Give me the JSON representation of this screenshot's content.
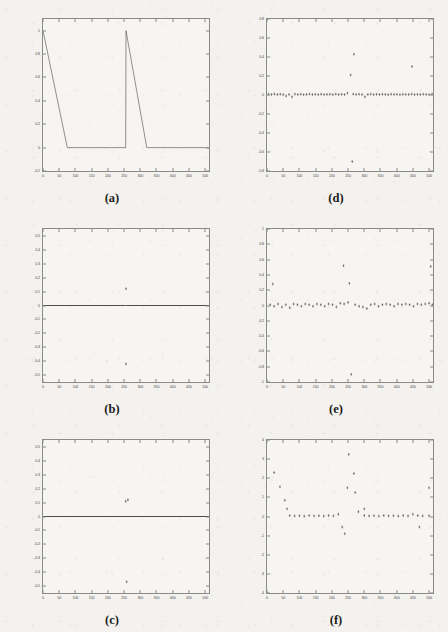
{
  "figure": {
    "background_color": "#f3f2ee",
    "axis_color": "#8a8a86",
    "data_color": "#3a3a38",
    "panel_count": 6
  },
  "chart_data": [
    {
      "type": "line",
      "panel": "a",
      "caption": "(a)",
      "title": "",
      "xlabel": "",
      "ylabel": "",
      "xlim": [
        0,
        512
      ],
      "ylim": [
        -0.2,
        1.1
      ],
      "grid": false,
      "legend": null,
      "xticks": [
        0,
        50,
        100,
        150,
        200,
        250,
        300,
        350,
        400,
        450,
        500
      ],
      "yticks": [
        -0.2,
        0,
        0.2,
        0.4,
        0.6,
        0.8,
        1
      ],
      "ytick_labels": [
        "-0.2",
        "0",
        "0.2",
        "0.4",
        "0.6",
        "0.8",
        "1"
      ],
      "series": [
        {
          "name": "autocorrelation",
          "x": [
            0,
            75,
            255,
            256,
            320,
            512
          ],
          "values": [
            1,
            0,
            0,
            1,
            0,
            0
          ]
        }
      ]
    },
    {
      "type": "scatter",
      "panel": "d",
      "caption": "(d)",
      "title": "",
      "xlabel": "",
      "ylabel": "",
      "xlim": [
        0,
        512
      ],
      "ylim": [
        -0.8,
        0.8
      ],
      "grid": false,
      "legend": null,
      "xticks": [
        0,
        50,
        100,
        150,
        200,
        250,
        300,
        350,
        400,
        450,
        500
      ],
      "yticks": [
        -0.8,
        -0.6,
        -0.4,
        -0.2,
        0,
        0.2,
        0.4,
        0.6,
        0.8
      ],
      "ytick_labels": [
        "-0.8",
        "-0.6",
        "-0.4",
        "-0.2",
        "0",
        "0.2",
        "0.4",
        "0.6",
        "0.8"
      ],
      "series": [
        {
          "name": "residual",
          "x": [
            5,
            14,
            23,
            32,
            41,
            50,
            59,
            68,
            77,
            86,
            95,
            104,
            113,
            122,
            131,
            140,
            149,
            158,
            167,
            176,
            185,
            194,
            203,
            212,
            221,
            230,
            239,
            248,
            266,
            275,
            284,
            293,
            302,
            311,
            320,
            329,
            338,
            347,
            356,
            365,
            374,
            383,
            392,
            401,
            410,
            419,
            428,
            437,
            446,
            455,
            464,
            473,
            482,
            491,
            500,
            509
          ],
          "values": [
            0.01,
            0.005,
            0.01,
            0.005,
            0.008,
            0.004,
            -0.01,
            0.006,
            -0.02,
            0.01,
            0.005,
            0.008,
            0.004,
            0.006,
            0.01,
            0.005,
            0.007,
            0.004,
            0.009,
            0.005,
            0.006,
            0.008,
            0.004,
            0.01,
            0.005,
            0.007,
            0.004,
            0.02,
            0.01,
            0.006,
            0.008,
            0.005,
            -0.02,
            0.006,
            0.009,
            0.004,
            0.007,
            0.005,
            0.008,
            0.006,
            0.004,
            0.009,
            0.005,
            0.007,
            0.004,
            0.008,
            0.006,
            0.005,
            0.009,
            0.004,
            0.007,
            0.005,
            0.008,
            0.006,
            0.004,
            0.01
          ]
        },
        {
          "name": "outliers",
          "x": [
            258,
            268,
            263,
            447
          ],
          "values": [
            0.21,
            0.43,
            -0.7,
            0.3
          ]
        }
      ]
    },
    {
      "type": "line",
      "panel": "b",
      "caption": "(b)",
      "title": "",
      "xlabel": "",
      "ylabel": "",
      "xlim": [
        0,
        512
      ],
      "ylim": [
        -0.55,
        0.55
      ],
      "grid": false,
      "legend": null,
      "xticks": [
        0,
        50,
        100,
        150,
        200,
        250,
        300,
        350,
        400,
        450,
        500
      ],
      "yticks": [
        -0.5,
        -0.4,
        -0.3,
        -0.2,
        -0.1,
        0,
        0.1,
        0.2,
        0.3,
        0.4,
        0.5
      ],
      "ytick_labels": [
        "-0.5",
        "-0.4",
        "-0.3",
        "-0.2",
        "-0.1",
        "0",
        "0.1",
        "0.2",
        "0.3",
        "0.4",
        "0.5"
      ],
      "series": [
        {
          "name": "flat-signal",
          "x": [
            0,
            255,
            258,
            512
          ],
          "values": [
            0,
            0,
            0,
            0
          ]
        },
        {
          "name": "outliers",
          "x": [
            256,
            256
          ],
          "values": [
            0.12,
            -0.42
          ]
        }
      ]
    },
    {
      "type": "scatter",
      "panel": "e",
      "caption": "(e)",
      "title": "",
      "xlabel": "",
      "ylabel": "",
      "xlim": [
        0,
        512
      ],
      "ylim": [
        -1,
        1
      ],
      "grid": false,
      "legend": null,
      "xticks": [
        0,
        50,
        100,
        150,
        200,
        250,
        300,
        350,
        400,
        450,
        500
      ],
      "yticks": [
        -1,
        -0.8,
        -0.6,
        -0.4,
        -0.2,
        0,
        0.2,
        0.4,
        0.6,
        0.8,
        1
      ],
      "ytick_labels": [
        "-1",
        "-0.8",
        "-0.6",
        "-0.4",
        "-0.2",
        "0",
        "0.2",
        "0.4",
        "0.6",
        "0.8",
        "1"
      ],
      "series": [
        {
          "name": "residual",
          "x": [
            10,
            22,
            34,
            46,
            58,
            70,
            82,
            94,
            106,
            118,
            130,
            142,
            154,
            166,
            178,
            190,
            202,
            214,
            226,
            238,
            250,
            272,
            284,
            296,
            308,
            320,
            332,
            344,
            356,
            368,
            380,
            392,
            404,
            416,
            428,
            440,
            452,
            464,
            476,
            488,
            500,
            510
          ],
          "values": [
            0.01,
            -0.01,
            0.02,
            -0.02,
            0.01,
            -0.03,
            0.02,
            0.01,
            -0.01,
            0.02,
            0.01,
            -0.01,
            0.02,
            0.01,
            -0.01,
            0.02,
            0.01,
            -0.02,
            0.03,
            0.02,
            0.04,
            0.01,
            -0.01,
            -0.02,
            -0.04,
            0.01,
            0.02,
            -0.01,
            0.01,
            0.02,
            0.01,
            -0.01,
            0.02,
            0.01,
            0.02,
            0.01,
            -0.01,
            0.02,
            0.01,
            0.02,
            0.03,
            0.01
          ]
        },
        {
          "name": "outliers",
          "x": [
            18,
            236,
            254,
            260,
            505
          ],
          "values": [
            0.28,
            0.52,
            0.29,
            -0.9,
            0.51
          ]
        }
      ]
    },
    {
      "type": "line",
      "panel": "c",
      "caption": "(c)",
      "title": "",
      "xlabel": "",
      "ylabel": "",
      "xlim": [
        0,
        512
      ],
      "ylim": [
        -0.55,
        0.55
      ],
      "grid": false,
      "legend": null,
      "xticks": [
        0,
        50,
        100,
        150,
        200,
        250,
        300,
        350,
        400,
        450,
        500
      ],
      "yticks": [
        -0.5,
        -0.4,
        -0.3,
        -0.2,
        -0.1,
        0,
        0.1,
        0.2,
        0.3,
        0.4,
        0.5
      ],
      "ytick_labels": [
        "-0.5",
        "-0.4",
        "-0.3",
        "-0.2",
        "-0.1",
        "0",
        "0.1",
        "0.2",
        "0.3",
        "0.4",
        "0.5"
      ],
      "series": [
        {
          "name": "flat-signal",
          "x": [
            0,
            253,
            262,
            512
          ],
          "values": [
            0,
            0,
            0,
            0
          ]
        },
        {
          "name": "outliers",
          "x": [
            255,
            262,
            258
          ],
          "values": [
            0.11,
            0.12,
            -0.47
          ]
        }
      ]
    },
    {
      "type": "scatter",
      "panel": "f",
      "caption": "(f)",
      "title": "",
      "xlabel": "",
      "ylabel": "",
      "xlim": [
        0,
        512
      ],
      "ylim": [
        -4,
        4
      ],
      "grid": false,
      "legend": null,
      "xticks": [
        0,
        50,
        100,
        150,
        200,
        250,
        300,
        350,
        400,
        450,
        500
      ],
      "yticks": [
        -4,
        -3,
        -2,
        -1,
        0,
        1,
        2,
        3,
        4
      ],
      "ytick_labels": [
        "-4",
        "-3",
        "-2",
        "-1",
        "0",
        "1",
        "2",
        "3",
        "4"
      ],
      "series": [
        {
          "name": "residual",
          "x": [
            70,
            85,
            100,
            115,
            130,
            145,
            160,
            175,
            190,
            205,
            220,
            300,
            315,
            330,
            345,
            360,
            375,
            390,
            405,
            420,
            435,
            450,
            465,
            480,
            500
          ],
          "values": [
            0.05,
            0.03,
            0.04,
            0.02,
            0.05,
            0.03,
            0.04,
            0.02,
            0.05,
            0.03,
            0.12,
            0.05,
            0.03,
            0.04,
            0.02,
            0.05,
            0.03,
            0.04,
            0.02,
            0.05,
            0.03,
            0.12,
            0.05,
            0.03,
            0.04
          ]
        },
        {
          "name": "outliers",
          "x": [
            22,
            40,
            55,
            62,
            232,
            240,
            248,
            252,
            268,
            272,
            282,
            300,
            470,
            500
          ],
          "values": [
            2.3,
            1.55,
            0.85,
            0.4,
            -0.55,
            -0.9,
            1.5,
            3.25,
            2.25,
            1.25,
            0.25,
            0.4,
            -0.55,
            1.5
          ]
        }
      ]
    }
  ]
}
